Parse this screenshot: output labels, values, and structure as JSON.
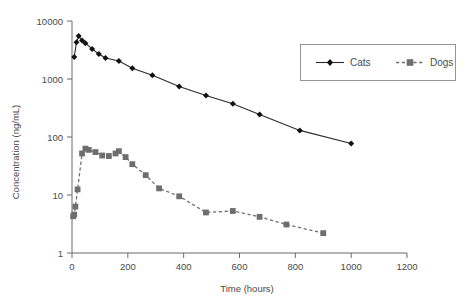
{
  "chart_data": {
    "type": "line",
    "title": "",
    "xlabel": "Time (hours)",
    "ylabel": "Concentration (ng/mL)",
    "yscale": "log",
    "xscale": "linear",
    "xlim": [
      0,
      1200
    ],
    "ylim": [
      1,
      10000
    ],
    "xticks": [
      0,
      200,
      400,
      600,
      800,
      1000,
      1200
    ],
    "yticks": [
      1,
      10,
      100,
      1000,
      10000
    ],
    "xtick_labels": [
      "0",
      "200",
      "400",
      "600",
      "800",
      "1000",
      "1200"
    ],
    "ytick_labels": [
      "1",
      "10",
      "100",
      "1000",
      "10000"
    ],
    "grid": false,
    "legend_position": "upper right",
    "series": [
      {
        "name": "Cats",
        "marker": "diamond",
        "linestyle": "solid",
        "color": "#111111",
        "points": [
          [
            8,
            2400
          ],
          [
            16,
            4300
          ],
          [
            24,
            5500
          ],
          [
            36,
            4600
          ],
          [
            48,
            4150
          ],
          [
            72,
            3300
          ],
          [
            96,
            2700
          ],
          [
            120,
            2300
          ],
          [
            168,
            2050
          ],
          [
            216,
            1530
          ],
          [
            288,
            1160
          ],
          [
            384,
            745
          ],
          [
            480,
            520
          ],
          [
            576,
            375
          ],
          [
            672,
            245
          ],
          [
            816,
            130
          ],
          [
            1000,
            77
          ]
        ]
      },
      {
        "name": "Dogs",
        "marker": "square",
        "linestyle": "dashed",
        "color": "#6e6e6e",
        "points": [
          [
            4,
            4.3
          ],
          [
            8,
            4.6
          ],
          [
            12,
            6.3
          ],
          [
            20,
            12.5
          ],
          [
            36,
            52
          ],
          [
            48,
            63
          ],
          [
            60,
            60
          ],
          [
            84,
            55
          ],
          [
            108,
            48
          ],
          [
            132,
            47
          ],
          [
            156,
            52
          ],
          [
            168,
            57
          ],
          [
            192,
            45
          ],
          [
            216,
            34
          ],
          [
            264,
            22
          ],
          [
            312,
            13
          ],
          [
            384,
            9.5
          ],
          [
            480,
            5.0
          ],
          [
            576,
            5.3
          ],
          [
            672,
            4.2
          ],
          [
            768,
            3.1
          ],
          [
            900,
            2.2
          ]
        ]
      }
    ]
  },
  "legend": {
    "entries": [
      {
        "label": "Cats"
      },
      {
        "label": "Dogs"
      }
    ]
  },
  "axes": {
    "x_title": "Time (hours)",
    "y_title": "Concentration (ng/mL)"
  }
}
